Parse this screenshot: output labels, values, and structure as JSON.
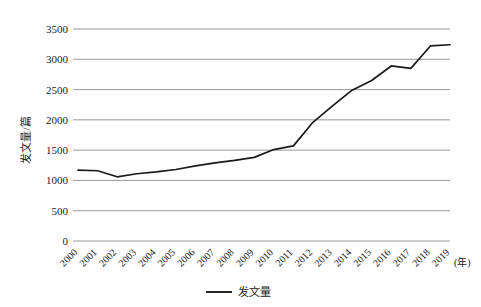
{
  "chart_data": {
    "type": "line",
    "title": "",
    "subtitle": "",
    "xlabel": "(年)",
    "ylabel": "发文量/篇",
    "x": [
      2000,
      2001,
      2002,
      2003,
      2004,
      2005,
      2006,
      2007,
      2008,
      2009,
      2010,
      2011,
      2012,
      2013,
      2014,
      2015,
      2016,
      2017,
      2018,
      2019
    ],
    "categories": [
      "2000",
      "2001",
      "2002",
      "2003",
      "2004",
      "2005",
      "2006",
      "2007",
      "2008",
      "2009",
      "2010",
      "2011",
      "2012",
      "2013",
      "2014",
      "2015",
      "2016",
      "2017",
      "2018",
      "2019"
    ],
    "series": [
      {
        "name": "发文量",
        "values": [
          1170,
          1160,
          1060,
          1110,
          1140,
          1180,
          1240,
          1290,
          1330,
          1380,
          1510,
          1570,
          1960,
          2230,
          2490,
          2650,
          2890,
          2850,
          3220,
          3240
        ],
        "color": "#1a1a1a"
      }
    ],
    "ylim": [
      0,
      3500
    ],
    "ytick_labels": [
      "0",
      "500",
      "1000",
      "1500",
      "2000",
      "2500",
      "3000",
      "3500"
    ],
    "ytick_values": [
      0,
      500,
      1000,
      1500,
      2000,
      2500,
      3000,
      3500
    ],
    "grid": true,
    "grid_axis": "y",
    "legend_position": "bottom",
    "legend_entries": [
      "发文量"
    ],
    "xtick_rotation": 45,
    "colors": {
      "line": "#1a1a1a",
      "grid": "#808080",
      "text": "#222222",
      "background": "#ffffff"
    }
  },
  "axes": {
    "y_axis_title": "发文量/篇",
    "x_unit_label": "(年)"
  },
  "legend": {
    "item_label": "发文量"
  }
}
